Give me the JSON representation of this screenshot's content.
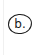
{
  "panel": {
    "label": "b.",
    "background": "#ffffff",
    "stroke_color": "#1a1a1a"
  }
}
